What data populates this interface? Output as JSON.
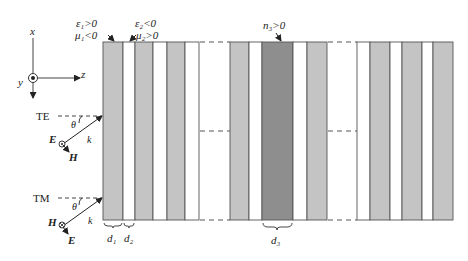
{
  "colors": {
    "light_layer": "#c4c4c4",
    "dark_layer": "#8e8e8e",
    "white_layer": "#ffffff",
    "stroke": "#555555",
    "text": "#222222"
  },
  "axes": {
    "x_label": "x",
    "y_label": "y",
    "z_label": "z"
  },
  "material_labels": {
    "layer1_eps": "ε₁>0",
    "layer1_mu": "μ₁<0",
    "layer2_eps": "ε₂<0",
    "layer2_mu": "μ₂>0",
    "defect": "n₃>0"
  },
  "te_wave": {
    "mode": "TE",
    "angle": "θ",
    "wavevector": "k",
    "field_out_of_plane": "E",
    "field_in_plane": "H"
  },
  "tm_wave": {
    "mode": "TM",
    "angle": "θ",
    "wavevector": "k",
    "field_out_of_plane": "H",
    "field_in_plane": "E"
  },
  "thickness_labels": {
    "d1": "d₁",
    "d2": "d₂",
    "d3": "d₃"
  },
  "structure": {
    "top": 42,
    "bottom": 220,
    "blocks": [
      {
        "name": "left-periodic-stack",
        "layers": [
          {
            "x": 103,
            "w": 20,
            "type": "light"
          },
          {
            "x": 123,
            "w": 12,
            "type": "white"
          },
          {
            "x": 135,
            "w": 18,
            "type": "light"
          },
          {
            "x": 153,
            "w": 14,
            "type": "white"
          },
          {
            "x": 167,
            "w": 18,
            "type": "light"
          },
          {
            "x": 185,
            "w": 14,
            "type": "white"
          }
        ]
      },
      {
        "name": "defect-stack",
        "layers": [
          {
            "x": 230,
            "w": 19,
            "type": "light"
          },
          {
            "x": 249,
            "w": 13,
            "type": "white"
          },
          {
            "x": 262,
            "w": 31,
            "type": "dark"
          },
          {
            "x": 293,
            "w": 14,
            "type": "white"
          },
          {
            "x": 307,
            "w": 20,
            "type": "light"
          }
        ]
      },
      {
        "name": "right-periodic-stack",
        "layers": [
          {
            "x": 357,
            "w": 13,
            "type": "white"
          },
          {
            "x": 370,
            "w": 20,
            "type": "light"
          },
          {
            "x": 390,
            "w": 12,
            "type": "white"
          },
          {
            "x": 402,
            "w": 20,
            "type": "light"
          },
          {
            "x": 422,
            "w": 11,
            "type": "white"
          },
          {
            "x": 433,
            "w": 20,
            "type": "light"
          }
        ]
      }
    ]
  }
}
